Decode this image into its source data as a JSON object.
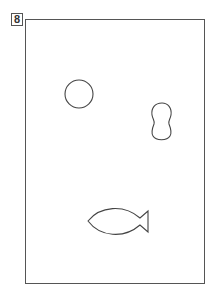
{
  "page": {
    "number": "8"
  },
  "shapes": [
    {
      "name": "circle",
      "label": "circle"
    },
    {
      "name": "peanut",
      "label": "peanut shape"
    },
    {
      "name": "fish",
      "label": "fish"
    }
  ],
  "colors": {
    "stroke": "#444444",
    "background": "#ffffff"
  }
}
